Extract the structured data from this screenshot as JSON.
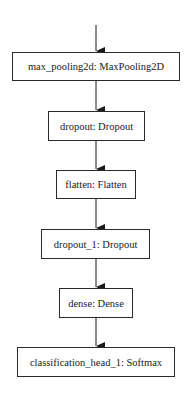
{
  "diagram": {
    "type": "flowchart",
    "direction": "top-to-bottom",
    "nodes": [
      {
        "id": "max_pooling2d",
        "label": "max_pooling2d: MaxPooling2D",
        "x": 12,
        "y": 52,
        "w": 168,
        "h": 29
      },
      {
        "id": "dropout",
        "label": "dropout: Dropout",
        "x": 48,
        "y": 111,
        "w": 97,
        "h": 30
      },
      {
        "id": "flatten",
        "label": "flatten: Flatten",
        "x": 56,
        "y": 170,
        "w": 80,
        "h": 29
      },
      {
        "id": "dropout_1",
        "label": "dropout_1: Dropout",
        "x": 41,
        "y": 229,
        "w": 109,
        "h": 30
      },
      {
        "id": "dense",
        "label": "dense: Dense",
        "x": 59,
        "y": 288,
        "w": 74,
        "h": 30
      },
      {
        "id": "classification_head_1",
        "label": "classification_head_1: Softmax",
        "x": 17,
        "y": 347,
        "w": 158,
        "h": 30
      }
    ],
    "edges": [
      {
        "from": null,
        "to": "max_pooling2d"
      },
      {
        "from": "max_pooling2d",
        "to": "dropout"
      },
      {
        "from": "dropout",
        "to": "flatten"
      },
      {
        "from": "flatten",
        "to": "dropout_1"
      },
      {
        "from": "dropout_1",
        "to": "dense"
      },
      {
        "from": "dense",
        "to": "classification_head_1"
      }
    ],
    "colors": {
      "stroke": "#2a2a2a",
      "fill": "#ffffff",
      "text": "#1a1a1a"
    }
  }
}
